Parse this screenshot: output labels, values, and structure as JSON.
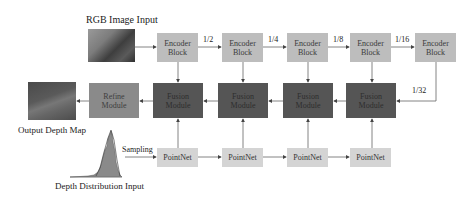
{
  "title_rgb": "RGB Image Input",
  "output_label": "Output Depth Map",
  "distribution_label": "Depth Distribution Input",
  "sampling_label": "Sampling",
  "encoder": {
    "blocks": [
      {
        "line1": "Encoder",
        "line2": "Block"
      },
      {
        "line1": "Encoder",
        "line2": "Block"
      },
      {
        "line1": "Encoder",
        "line2": "Block"
      },
      {
        "line1": "Encoder",
        "line2": "Block"
      },
      {
        "line1": "Encoder",
        "line2": "Block"
      }
    ],
    "scales": [
      "1/2",
      "1/4",
      "1/8",
      "1/16",
      "1/32"
    ]
  },
  "fusion": {
    "modules": [
      {
        "line1": "Fusion",
        "line2": "Module"
      },
      {
        "line1": "Fusion",
        "line2": "Module"
      },
      {
        "line1": "Fusion",
        "line2": "Module"
      },
      {
        "line1": "Fusion",
        "line2": "Module"
      }
    ]
  },
  "refine": {
    "line1": "Refine",
    "line2": "Module"
  },
  "pointnet": {
    "blocks": [
      "PointNet",
      "PointNet",
      "PointNet",
      "PointNet"
    ]
  },
  "colors": {
    "encoder": "#bdbdbd",
    "fusion": "#555555",
    "refine": "#8a8a8a",
    "pointnet": "#d4d4d4",
    "arrow": "#555555"
  }
}
